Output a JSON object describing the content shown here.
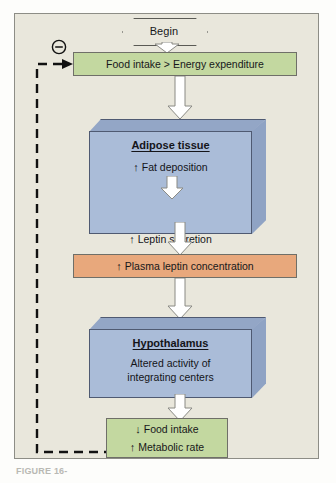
{
  "figure": {
    "caption": "FIGURE 16-",
    "background_color": "#e9e7dc",
    "border_color": "#8d8d86"
  },
  "colors": {
    "green_box": "#c3d8a0",
    "orange_box": "#e8a87c",
    "blue_block_face": "#aabcd8",
    "blue_block_top": "#93a6c6",
    "blue_block_side": "#8fa3c4",
    "outline": "#4f5a72",
    "arrow_fill": "#ffffff",
    "arrow_outline": "#8a8a84",
    "dashed_line": "#111111"
  },
  "diagram": {
    "start_node": {
      "label": "Begin",
      "shape": "hexagon"
    },
    "feedback_marker": {
      "symbol": "⊖",
      "meaning": "negative-feedback"
    },
    "steps": [
      {
        "id": "food-intake",
        "type": "flat-box",
        "color": "green",
        "lines": [
          {
            "arrow": "",
            "text": "Food intake > Energy expenditure"
          }
        ]
      },
      {
        "id": "adipose-tissue",
        "type": "block-3d",
        "color": "blue",
        "title": "Adipose tissue",
        "lines": [
          {
            "arrow": "↑",
            "text": "Fat deposition"
          },
          {
            "arrow": "↑",
            "text": "Leptin secretion"
          }
        ],
        "internal_arrow": true
      },
      {
        "id": "plasma-leptin",
        "type": "flat-box",
        "color": "orange",
        "lines": [
          {
            "arrow": "↑",
            "text": "Plasma leptin concentration"
          }
        ]
      },
      {
        "id": "hypothalamus",
        "type": "block-3d",
        "color": "blue",
        "title": "Hypothalamus",
        "lines": [
          {
            "arrow": "",
            "text": "Altered activity of"
          },
          {
            "arrow": "",
            "text": "integrating centers"
          }
        ],
        "internal_arrow": false
      },
      {
        "id": "outcome",
        "type": "flat-box",
        "color": "green",
        "lines": [
          {
            "arrow": "↓",
            "text": "Food intake"
          },
          {
            "arrow": "↑",
            "text": "Metabolic rate"
          }
        ]
      }
    ]
  }
}
